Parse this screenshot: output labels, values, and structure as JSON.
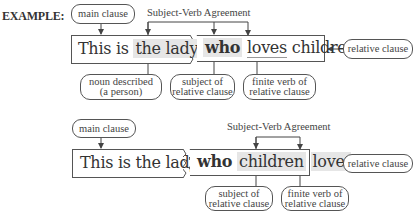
{
  "label": "EXAMPLE:",
  "diagrams": [
    {
      "main_clause_label": "main clause",
      "agreement_label": "Subject-Verb Agreement",
      "relative_clause_label": "relative clause",
      "main_clause_text": {
        "plain": "This is",
        "highlighted": "the lady"
      },
      "relative_clause_text": {
        "pronoun": "who",
        "verb": "loves",
        "rest": "children."
      },
      "annotations": [
        {
          "line1": "noun described",
          "line2": "(a person)"
        },
        {
          "line1": "subject of",
          "line2": "relative clause"
        },
        {
          "line1": "finite verb of",
          "line2": "relative clause"
        }
      ]
    },
    {
      "main_clause_label": "main clause",
      "agreement_label": "Subject-Verb Agreement",
      "relative_clause_label": "relative clause",
      "main_clause_text": {
        "plain": "This is the lady"
      },
      "relative_clause_text": {
        "pronoun": "who",
        "subject": "children",
        "verb": "love."
      },
      "annotations": [
        {
          "line1": "subject of",
          "line2": "relative clause"
        },
        {
          "line1": "finite verb of",
          "line2": "relative clause"
        }
      ]
    }
  ]
}
